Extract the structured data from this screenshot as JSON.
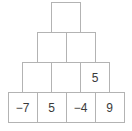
{
  "diagram": {
    "kind": "number-pyramid",
    "title": "",
    "colors": {
      "cell_border": "#b3b3b3",
      "cell_fill": "#ffffff",
      "text": "#3a3a3a",
      "background": "#ffffff"
    },
    "rows": [
      {
        "index": 0,
        "cells": [
          {
            "value": "",
            "filled": false
          }
        ]
      },
      {
        "index": 1,
        "cells": [
          {
            "value": "",
            "filled": false
          },
          {
            "value": "",
            "filled": false
          }
        ]
      },
      {
        "index": 2,
        "cells": [
          {
            "value": "",
            "filled": false
          },
          {
            "value": "",
            "filled": false
          },
          {
            "value": "5",
            "filled": true
          }
        ]
      },
      {
        "index": 3,
        "cells": [
          {
            "value": "−7",
            "filled": true
          },
          {
            "value": "5",
            "filled": true
          },
          {
            "value": "−4",
            "filled": true
          },
          {
            "value": "9",
            "filled": true
          }
        ]
      }
    ]
  }
}
